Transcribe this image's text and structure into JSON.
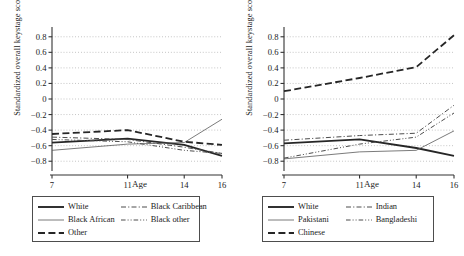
{
  "figure": {
    "background": "#ffffff",
    "panels": [
      "left",
      "right"
    ]
  },
  "axis": {
    "ylabel": "Standardized overall keystage score",
    "xlabel": "Age",
    "yticks": [
      "0.8",
      "0.6",
      "0.4",
      "0.2",
      "0",
      "−0.2",
      "−0.4",
      "−0.6",
      "−0.8"
    ],
    "ytick_values": [
      0.8,
      0.6,
      0.4,
      0.2,
      0,
      -0.2,
      -0.4,
      -0.6,
      -0.8
    ],
    "xticks": [
      "7",
      "11",
      "14",
      "16"
    ],
    "xtick_values": [
      7,
      11,
      14,
      16
    ],
    "ylim": [
      -0.9,
      0.9
    ],
    "xlim": [
      7,
      16
    ],
    "grid": "horizontal-dotted"
  },
  "chart_data": [
    {
      "type": "line",
      "title": "",
      "panel": "left",
      "xlabel": "Age",
      "ylabel": "Standardized overall keystage score",
      "x": [
        7,
        11,
        14,
        16
      ],
      "ylim": [
        -0.9,
        0.9
      ],
      "xlim": [
        7,
        16
      ],
      "grid": true,
      "legend_position": "below",
      "series": [
        {
          "name": "White",
          "values": [
            -0.56,
            -0.51,
            -0.59,
            -0.73
          ],
          "style": "solid",
          "width": 1.8,
          "color": "#262626"
        },
        {
          "name": "Black African",
          "values": [
            -0.66,
            -0.58,
            -0.56,
            -0.26
          ],
          "style": "thin-solid",
          "width": 0.8,
          "color": "#595959"
        },
        {
          "name": "Other",
          "values": [
            -0.45,
            -0.4,
            -0.55,
            -0.59
          ],
          "style": "long-dash",
          "width": 1.8,
          "color": "#262626"
        },
        {
          "name": "Black Caribbean",
          "values": [
            -0.49,
            -0.52,
            -0.62,
            -0.7
          ],
          "style": "dash-dot",
          "width": 1.0,
          "color": "#4d4d4d"
        },
        {
          "name": "Black other",
          "values": [
            -0.52,
            -0.55,
            -0.66,
            -0.7
          ],
          "style": "dash-dot-dot",
          "width": 1.0,
          "color": "#4d4d4d"
        }
      ]
    },
    {
      "type": "line",
      "title": "",
      "panel": "right",
      "xlabel": "Age",
      "ylabel": "Standardized overall keystage score",
      "x": [
        7,
        11,
        14,
        16
      ],
      "ylim": [
        -0.9,
        0.9
      ],
      "xlim": [
        7,
        16
      ],
      "grid": true,
      "legend_position": "below",
      "series": [
        {
          "name": "White",
          "values": [
            -0.57,
            -0.52,
            -0.63,
            -0.73
          ],
          "style": "solid",
          "width": 1.8,
          "color": "#262626"
        },
        {
          "name": "Pakistani",
          "values": [
            -0.77,
            -0.68,
            -0.66,
            -0.41
          ],
          "style": "thin-solid",
          "width": 0.8,
          "color": "#595959"
        },
        {
          "name": "Chinese",
          "values": [
            0.1,
            0.27,
            0.41,
            0.82
          ],
          "style": "long-dash",
          "width": 1.8,
          "color": "#262626"
        },
        {
          "name": "Indian",
          "values": [
            -0.53,
            -0.47,
            -0.44,
            -0.08
          ],
          "style": "dash-dot",
          "width": 1.0,
          "color": "#4d4d4d"
        },
        {
          "name": "Bangladeshi",
          "values": [
            -0.76,
            -0.58,
            -0.49,
            -0.18
          ],
          "style": "dash-dot-dot",
          "width": 1.0,
          "color": "#4d4d4d"
        }
      ]
    }
  ],
  "legends": {
    "left": {
      "items": [
        {
          "label": "White",
          "style": "solid"
        },
        {
          "label": "Black Caribbean",
          "style": "dash-dot"
        },
        {
          "label": "Black African",
          "style": "thin-solid"
        },
        {
          "label": "Black other",
          "style": "dash-dot-dot"
        },
        {
          "label": "Other",
          "style": "long-dash"
        }
      ]
    },
    "right": {
      "items": [
        {
          "label": "White",
          "style": "solid"
        },
        {
          "label": "Indian",
          "style": "dash-dot"
        },
        {
          "label": "Pakistani",
          "style": "thin-solid"
        },
        {
          "label": "Bangladeshi",
          "style": "dash-dot-dot"
        },
        {
          "label": "Chinese",
          "style": "long-dash"
        }
      ]
    }
  }
}
